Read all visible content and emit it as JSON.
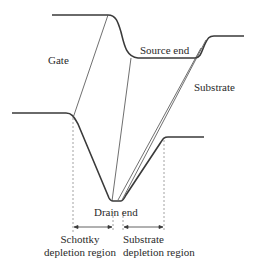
{
  "diagram": {
    "type": "energy-band-diagram",
    "labels": {
      "gate": "Gate",
      "source_end": "Source end",
      "substrate": "Substrate",
      "drain_end": "Drain end",
      "schottky_line1": "Schottky",
      "schottky_line2": "depletion region",
      "substrate_dep_line1": "Substrate",
      "substrate_dep_line2": "depletion region"
    },
    "colors": {
      "curve": "#3a3a3a",
      "thin_line": "#4a4a4a",
      "dashed": "#8a8a8a",
      "text": "#2a2a2a"
    }
  }
}
